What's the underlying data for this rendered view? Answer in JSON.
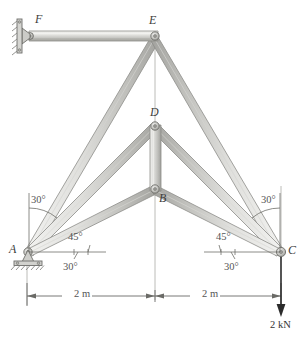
{
  "figure": {
    "type": "structural-truss-diagram",
    "width": 308,
    "height": 338,
    "background": "#ffffff"
  },
  "colors": {
    "member_fill_light": "#e8e8e6",
    "member_fill_mid": "#cfcfcb",
    "member_fill_dark": "#a9a9a5",
    "member_outline": "#8a8a86",
    "joint_fill": "#bdbdb9",
    "joint_outline": "#6e6e6a",
    "ground_hatch": "#7a7a76",
    "centerline": "#b4b4b0",
    "dimension_line": "#6a6a66",
    "load_arrow": "#2b2b2b",
    "text": "#4a4a4a"
  },
  "joints": [
    {
      "id": "A",
      "label": "A",
      "x": 27,
      "y": 252,
      "label_x": 9,
      "label_y": 243,
      "support": "pin-ground"
    },
    {
      "id": "B",
      "label": "B",
      "x": 155,
      "y": 190,
      "label_x": 159,
      "label_y": 192,
      "support": "none"
    },
    {
      "id": "C",
      "label": "C",
      "x": 281,
      "y": 252,
      "label_x": 288,
      "label_y": 244,
      "support": "pin"
    },
    {
      "id": "D",
      "label": "D",
      "x": 155,
      "y": 125,
      "label_x": 150,
      "label_y": 106,
      "support": "none"
    },
    {
      "id": "E",
      "label": "E",
      "x": 155,
      "y": 35,
      "label_x": 149,
      "label_y": 14,
      "support": "none"
    },
    {
      "id": "F",
      "label": "F",
      "x": 31,
      "y": 35,
      "label_x": 35,
      "label_y": 13,
      "support": "pin-wall"
    }
  ],
  "members": [
    {
      "name": "member-FE",
      "from": "F",
      "to": "E",
      "width": 7
    },
    {
      "name": "member-EA",
      "from": "E",
      "to": "A",
      "width": 8
    },
    {
      "name": "member-EC",
      "from": "E",
      "to": "C",
      "width": 8
    },
    {
      "name": "member-DA",
      "from": "D",
      "to": "A",
      "width": 7
    },
    {
      "name": "member-DC",
      "from": "D",
      "to": "C",
      "width": 7
    },
    {
      "name": "member-BA",
      "from": "B",
      "to": "A",
      "width": 7
    },
    {
      "name": "member-BC",
      "from": "B",
      "to": "C",
      "width": 7
    },
    {
      "name": "member-DB",
      "from": "D",
      "to": "B",
      "width": 8
    }
  ],
  "angles": [
    {
      "name": "angle-left-upper",
      "text": "30°",
      "x": 31,
      "y": 195,
      "at": "A",
      "member": "EA"
    },
    {
      "name": "angle-left-mid",
      "text": "45°",
      "x": 68,
      "y": 232,
      "at": "A",
      "member": "DA"
    },
    {
      "name": "angle-left-lower",
      "text": "30°",
      "x": 63,
      "y": 262,
      "at": "A",
      "member": "BA"
    },
    {
      "name": "angle-right-upper",
      "text": "30°",
      "x": 261,
      "y": 195,
      "at": "C",
      "member": "EC"
    },
    {
      "name": "angle-right-mid",
      "text": "45°",
      "x": 216,
      "y": 232,
      "at": "C",
      "member": "DC"
    },
    {
      "name": "angle-right-lower",
      "text": "30°",
      "x": 224,
      "y": 262,
      "at": "C",
      "member": "BC"
    }
  ],
  "dimensions": [
    {
      "name": "dimension-left",
      "text": "2 m",
      "x": 74,
      "y": 288,
      "from_x": 27,
      "to_x": 155,
      "y_line": 296
    },
    {
      "name": "dimension-right",
      "text": "2 m",
      "x": 202,
      "y": 288,
      "from_x": 155,
      "to_x": 281,
      "y_line": 296
    }
  ],
  "loads": [
    {
      "name": "load-2kn",
      "text": "2 kN",
      "x": 271,
      "y": 320,
      "arrow_x": 281,
      "arrow_from_y": 256,
      "arrow_to_y": 314
    }
  ],
  "supports": {
    "A": {
      "type": "pin-on-ground",
      "x": 27,
      "y": 252
    },
    "C": {
      "type": "pin",
      "x": 281,
      "y": 252
    },
    "F": {
      "type": "pin-on-wall",
      "x": 31,
      "y": 35
    }
  }
}
